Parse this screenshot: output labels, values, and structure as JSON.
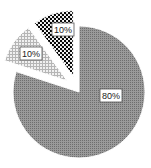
{
  "chart_data": {
    "type": "pie",
    "title": "",
    "categories": [
      "Slice A",
      "Slice B",
      "Slice C"
    ],
    "values": [
      80,
      10,
      10
    ],
    "labels": [
      "80%",
      "10%",
      "10%"
    ],
    "exploded": [
      false,
      true,
      true
    ],
    "patterns": [
      "dense-gray-grid",
      "light-gray-grid",
      "black-checker-dots"
    ],
    "colors": [
      "#8a8a8a",
      "#d4d4d4",
      "#111111"
    ],
    "legend": "none",
    "start_angle_deg": 0,
    "direction": "clockwise"
  }
}
